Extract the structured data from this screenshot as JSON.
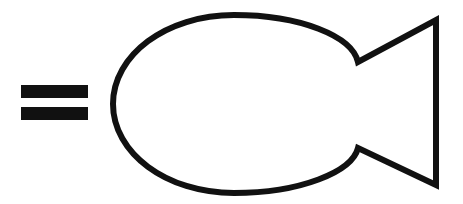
{
  "figure": {
    "title": "Equals sign followed by fish outline",
    "type": "line-drawing",
    "background_color": "#ffffff",
    "ink_color": "#111111",
    "width": 463,
    "height": 204
  },
  "equals_sign": {
    "label": "=",
    "name": "equals-sign",
    "bar_color": "#111111",
    "bars": [
      {
        "label": "upper-bar",
        "x": 21,
        "y": 85,
        "width": 67,
        "height": 13
      },
      {
        "label": "lower-bar",
        "x": 21,
        "y": 107,
        "width": 67,
        "height": 13
      }
    ]
  },
  "fish": {
    "name": "fish-outline",
    "stroke_color": "#111111",
    "fill_color": "#ffffff",
    "stroke_width": 6,
    "body": {
      "label": "fish-body",
      "shape": "oval",
      "left_tip_x": 113,
      "top_y": 15,
      "bottom_y": 193,
      "center_y": 104,
      "right_join_x": 358
    },
    "tail": {
      "label": "fish-tail",
      "shape": "triangular-notch",
      "notch_top_vertex": {
        "x": 358,
        "y": 62
      },
      "notch_bottom_vertex": {
        "x": 358,
        "y": 148
      },
      "back_top": {
        "x": 436,
        "y": 20
      },
      "back_bottom": {
        "x": 436,
        "y": 185
      }
    },
    "outline_path": "M 358 62 C 352 36 300 15 234 15 C 166 15 113 55 113 104 C 113 153 166 193 234 193 C 300 193 352 172 358 148 L 436 185 L 436 20 Z"
  }
}
